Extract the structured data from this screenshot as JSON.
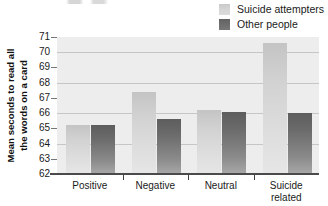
{
  "chart_data": {
    "type": "bar",
    "title": "",
    "subtitle": "",
    "xlabel": "",
    "ylabel": "Mean seconds to read all the words on a card",
    "ylabel_lines": [
      "Mean seconds to read all",
      "the words on a card"
    ],
    "categories": [
      "Positive",
      "Negative",
      "Neutral",
      "Suicide related"
    ],
    "category_lines": [
      [
        "Positive"
      ],
      [
        "Negative"
      ],
      [
        "Neutral"
      ],
      [
        "Suicide",
        "related"
      ]
    ],
    "series": [
      {
        "name": "Suicide attempters",
        "color": "#d2d2d2",
        "values": [
          65.2,
          67.4,
          66.2,
          70.6
        ]
      },
      {
        "name": "Other people",
        "color": "#6b6b6b",
        "values": [
          65.2,
          65.6,
          66.1,
          66.0
        ]
      }
    ],
    "ylim": [
      62,
      71
    ],
    "ytick_labels": [
      "71",
      "70",
      "69",
      "68",
      "67",
      "66",
      "65",
      "64",
      "63",
      "62"
    ],
    "ytick_values": [
      71,
      70,
      69,
      68,
      67,
      66,
      65,
      64,
      63,
      62
    ],
    "ytick_marks_at": [
      71,
      69,
      67,
      65,
      63
    ],
    "gridlines_at": [
      70,
      68,
      66,
      64
    ],
    "grid": true,
    "legend_position": "top-right",
    "plot_background": "#ededed",
    "gridline_color": "#c6c6c6",
    "axis_color": "#4a4a4a"
  },
  "legend": {
    "entries": [
      {
        "label": "Suicide attempters",
        "swatch": "light-gray-swatch"
      },
      {
        "label": "Other people",
        "swatch": "dark-gray-swatch"
      }
    ]
  }
}
